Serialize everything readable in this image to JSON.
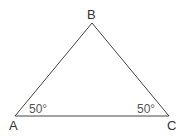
{
  "diagram": {
    "type": "triangle",
    "vertices": {
      "A": {
        "label": "A"
      },
      "B": {
        "label": "B"
      },
      "C": {
        "label": "C"
      }
    },
    "angles": {
      "A": {
        "label": "50°",
        "value_deg": 50
      },
      "C": {
        "label": "50°",
        "value_deg": 50
      }
    },
    "edges": [
      "AB",
      "BC",
      "CA"
    ],
    "line_color": "#444444",
    "text_color": "#333333"
  }
}
